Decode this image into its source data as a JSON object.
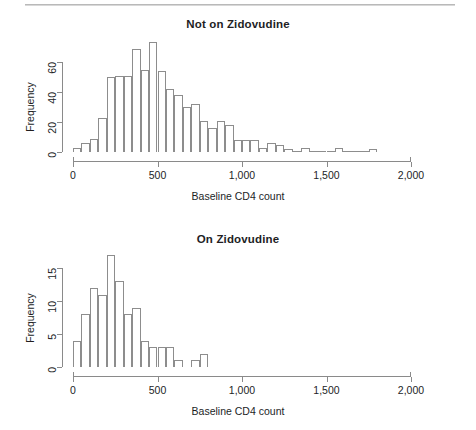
{
  "page": {
    "width": 476,
    "height": 430,
    "background": "#ffffff",
    "rule_color": "#b9b9b9",
    "text_color": "#231f20",
    "bar_stroke": "#8d8d8d",
    "axis_color": "#8a8a8a"
  },
  "figures": [
    {
      "id": "not-on-zidovudine",
      "title": "Not on Zidovudine",
      "xlabel": "Baseline CD4 count",
      "ylabel": "Frequency",
      "xticks": [
        0,
        500,
        1000,
        1500,
        2000
      ],
      "xtick_labels": [
        "0",
        "500",
        "1,000",
        "1,500",
        "2,000"
      ],
      "yticks": [
        0,
        20,
        40,
        60
      ],
      "ytick_labels": [
        "0",
        "20",
        "40",
        "60"
      ]
    },
    {
      "id": "on-zidovudine",
      "title": "On Zidovudine",
      "xlabel": "Baseline CD4 count",
      "ylabel": "Frequency",
      "xticks": [
        0,
        500,
        1000,
        1500,
        2000
      ],
      "xtick_labels": [
        "0",
        "500",
        "1,000",
        "1,500",
        "2,000"
      ],
      "yticks": [
        0,
        5,
        10,
        15
      ],
      "ytick_labels": [
        "0",
        "5",
        "10",
        "15"
      ]
    }
  ],
  "chart_data": [
    {
      "type": "bar",
      "subtype": "histogram",
      "id": "not-on-zidovudine",
      "title": "Not on Zidovudine",
      "xlabel": "Baseline CD4 count",
      "ylabel": "Frequency",
      "xlim": [
        0,
        2000
      ],
      "ylim": [
        0,
        75
      ],
      "bin_width": 50,
      "grid": false,
      "legend": "none",
      "bin_starts": [
        0,
        50,
        100,
        150,
        200,
        250,
        300,
        350,
        400,
        450,
        500,
        550,
        600,
        650,
        700,
        750,
        800,
        850,
        900,
        950,
        1000,
        1050,
        1100,
        1150,
        1200,
        1250,
        1300,
        1350,
        1400,
        1450,
        1500,
        1550,
        1600,
        1650,
        1700,
        1750
      ],
      "values": [
        3,
        6,
        9,
        23,
        50,
        51,
        51,
        69,
        55,
        74,
        54,
        42,
        38,
        30,
        32,
        21,
        16,
        21,
        18,
        8,
        8,
        8,
        3,
        6,
        5,
        2,
        1,
        3,
        1,
        1,
        1,
        3,
        1,
        1,
        1,
        2
      ]
    },
    {
      "type": "bar",
      "subtype": "histogram",
      "id": "on-zidovudine",
      "title": "On Zidovudine",
      "xlabel": "Baseline CD4 count",
      "ylabel": "Frequency",
      "xlim": [
        0,
        2000
      ],
      "ylim": [
        0,
        17
      ],
      "bin_width": 50,
      "grid": false,
      "legend": "none",
      "bin_starts": [
        0,
        50,
        100,
        150,
        200,
        250,
        300,
        350,
        400,
        450,
        500,
        550,
        600,
        650,
        700,
        750
      ],
      "values": [
        4,
        8,
        12,
        11,
        17,
        13,
        8,
        9,
        4,
        3,
        3,
        3,
        1,
        0,
        1,
        2
      ]
    }
  ]
}
